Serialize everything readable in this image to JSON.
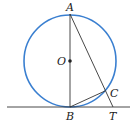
{
  "diagram": {
    "type": "geometry",
    "colors": {
      "circle": "#3a7fd0",
      "lines": "#333333"
    },
    "points": {
      "A": {
        "label": "A",
        "x": 70,
        "y": 14
      },
      "O": {
        "label": "O",
        "x": 70,
        "y": 61
      },
      "B": {
        "label": "B",
        "x": 70,
        "y": 107
      },
      "C": {
        "label": "C",
        "x": 105,
        "y": 91
      },
      "T": {
        "label": "T",
        "x": 113,
        "y": 107
      }
    }
  }
}
